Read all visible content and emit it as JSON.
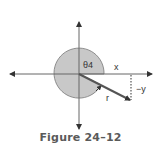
{
  "figure": {
    "caption": "Figure 24–12",
    "labels": {
      "angle": "θ4",
      "x": "x",
      "neg_y": "−y",
      "r": "r"
    },
    "colors": {
      "circle_fill": "#c8c8c8",
      "axis": "#555555",
      "vector": "#555555",
      "caption": "#5a5a5a"
    }
  }
}
